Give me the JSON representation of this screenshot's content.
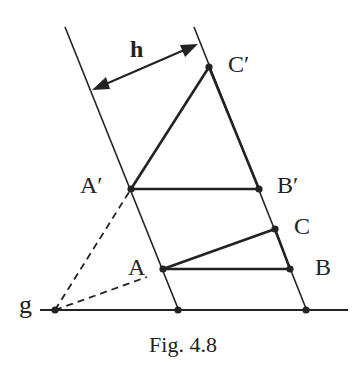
{
  "figure": {
    "caption": "Fig. 4.8",
    "colors": {
      "ink": "#222222",
      "background": "#ffffff"
    },
    "labels": {
      "h": "h",
      "g": "g",
      "A": "A",
      "B": "B",
      "C": "C",
      "A_prime": "A′",
      "B_prime": "B′",
      "C_prime": "C′"
    },
    "points": {
      "A": [
        163,
        269
      ],
      "B": [
        290,
        269
      ],
      "C": [
        275,
        229
      ],
      "A_prime": [
        131,
        189
      ],
      "B_prime": [
        259,
        189
      ],
      "C_prime": [
        209,
        67
      ],
      "g_point": [
        55,
        310
      ],
      "left_foot": [
        178,
        310
      ],
      "right_foot": [
        306,
        310
      ]
    },
    "lines": {
      "left_parallel": [
        [
          65,
          27
        ],
        [
          179,
          311
        ]
      ],
      "right_parallel": [
        [
          194,
          27
        ],
        [
          307,
          311
        ]
      ],
      "baseline_g": [
        [
          40,
          310
        ],
        [
          348,
          310
        ]
      ],
      "distance_arrow_h": [
        [
          92,
          90
        ],
        [
          198,
          44
        ]
      ],
      "dashed_to_A_prime": [
        [
          55,
          310
        ],
        [
          131,
          189
        ]
      ],
      "dashed_to_A": [
        [
          55,
          310
        ],
        [
          147,
          277
        ]
      ]
    },
    "triangles": {
      "ABC": [
        "A",
        "B",
        "C"
      ],
      "A_prime_B_prime_C_prime": [
        "A_prime",
        "B_prime",
        "C_prime"
      ]
    }
  }
}
